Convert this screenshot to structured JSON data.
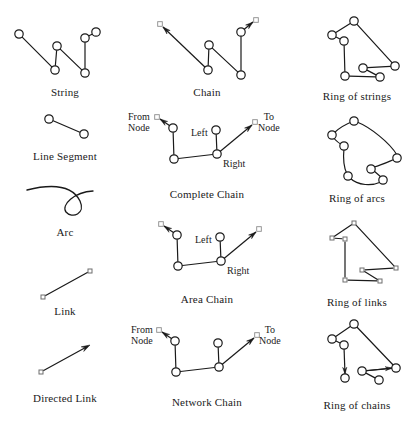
{
  "page": {
    "width": 414,
    "height": 422,
    "background": "#ffffff",
    "ink": "#1a1a1a"
  },
  "figures": [
    {
      "id": "string",
      "caption": "String",
      "caption_x": 65,
      "caption_y": 86,
      "node_style": "circle",
      "end_style": "none",
      "nodes": [
        [
          19,
          34
        ],
        [
          55,
          70
        ],
        [
          57,
          46
        ],
        [
          85,
          73
        ],
        [
          85,
          38
        ],
        [
          96,
          32
        ]
      ],
      "edges": [
        [
          0,
          1
        ],
        [
          1,
          2
        ],
        [
          2,
          3
        ],
        [
          3,
          4
        ],
        [
          4,
          5
        ]
      ]
    },
    {
      "id": "line-segment",
      "caption": "Line Segment",
      "caption_x": 65,
      "caption_y": 150,
      "node_style": "circle",
      "end_style": "none",
      "nodes": [
        [
          49,
          119
        ],
        [
          84,
          134
        ]
      ],
      "edges": [
        [
          0,
          1
        ]
      ]
    },
    {
      "id": "arc",
      "caption": "Arc",
      "caption_x": 65,
      "caption_y": 226,
      "node_style": "none",
      "end_style": "none",
      "curve": "M 27 190 C 55 183 73 187 80 201 C 86 214 72 219 66 212 C 61 205 74 192 93 191"
    },
    {
      "id": "link",
      "caption": "Link",
      "caption_x": 65,
      "caption_y": 305,
      "node_style": "square",
      "end_style": "none",
      "nodes": [
        [
          43,
          297
        ],
        [
          90,
          271
        ]
      ],
      "edges": [
        [
          0,
          1
        ]
      ]
    },
    {
      "id": "directed-link",
      "caption": "Directed Link",
      "caption_x": 65,
      "caption_y": 392,
      "node_style": "square",
      "end_style": "arrow-end",
      "nodes": [
        [
          41,
          372
        ],
        [
          90,
          345
        ]
      ],
      "edges": [
        [
          0,
          1
        ]
      ]
    },
    {
      "id": "chain",
      "caption": "Chain",
      "caption_x": 207,
      "caption_y": 86,
      "node_style": "circle",
      "end_style": "arrow-both",
      "nodes": [
        [
          208,
          70
        ],
        [
          209,
          45
        ],
        [
          241,
          75
        ],
        [
          241,
          32
        ]
      ],
      "edges": [
        [
          0,
          1
        ],
        [
          1,
          2
        ],
        [
          2,
          3
        ]
      ],
      "tail_arrow": {
        "from": [
          208,
          70
        ],
        "to": [
          163,
          27
        ],
        "marker": [
          160,
          24
        ]
      },
      "head_arrow": {
        "from": [
          241,
          32
        ],
        "to": [
          253,
          22
        ],
        "marker": [
          256,
          20
        ]
      }
    },
    {
      "id": "complete-chain",
      "caption": "Complete Chain",
      "caption_x": 207,
      "caption_y": 188,
      "node_style": "circle",
      "end_style": "arrow-both",
      "nodes": [
        [
          174,
          159
        ],
        [
          173,
          128
        ],
        [
          217,
          154
        ],
        [
          216,
          130
        ]
      ],
      "edges": [
        [
          0,
          1
        ],
        [
          0,
          2
        ],
        [
          2,
          3
        ]
      ],
      "tail_arrow": {
        "from": [
          173,
          128
        ],
        "to": [
          160,
          119
        ],
        "marker": [
          157,
          117
        ]
      },
      "head_arrow": {
        "from": [
          217,
          154
        ],
        "to": [
          252,
          125
        ],
        "marker": [
          255,
          122
        ]
      },
      "annotations": [
        {
          "text": "From\nNode",
          "x": 128,
          "y": 112
        },
        {
          "text": "Left",
          "x": 191,
          "y": 128
        },
        {
          "text": "Right",
          "x": 223,
          "y": 159
        },
        {
          "text": "To\nNode",
          "x": 258,
          "y": 112
        }
      ]
    },
    {
      "id": "area-chain",
      "caption": "Area Chain",
      "caption_x": 207,
      "caption_y": 293,
      "node_style": "circle",
      "end_style": "arrow-both",
      "nodes": [
        [
          178,
          266
        ],
        [
          177,
          235
        ],
        [
          221,
          261
        ],
        [
          220,
          237
        ]
      ],
      "edges": [
        [
          0,
          1
        ],
        [
          0,
          2
        ],
        [
          2,
          3
        ]
      ],
      "tail_arrow": {
        "from": [
          177,
          235
        ],
        "to": [
          164,
          226
        ],
        "marker": [
          161,
          224
        ]
      },
      "head_arrow": {
        "from": [
          221,
          261
        ],
        "to": [
          256,
          232
        ],
        "marker": [
          259,
          229
        ]
      },
      "annotations": [
        {
          "text": "Left",
          "x": 195,
          "y": 235
        },
        {
          "text": "Right",
          "x": 227,
          "y": 266
        }
      ]
    },
    {
      "id": "network-chain",
      "caption": "Network Chain",
      "caption_x": 207,
      "caption_y": 396,
      "node_style": "circle",
      "end_style": "arrow-both",
      "nodes": [
        [
          176,
          372
        ],
        [
          175,
          341
        ],
        [
          219,
          367
        ],
        [
          218,
          343
        ]
      ],
      "edges": [
        [
          0,
          1
        ],
        [
          0,
          2
        ],
        [
          2,
          3
        ]
      ],
      "tail_arrow": {
        "from": [
          175,
          341
        ],
        "to": [
          162,
          332
        ],
        "marker": [
          159,
          330
        ]
      },
      "head_arrow": {
        "from": [
          219,
          367
        ],
        "to": [
          254,
          338
        ],
        "marker": [
          257,
          335
        ]
      },
      "annotations": [
        {
          "text": "From\nNode",
          "x": 131,
          "y": 325
        },
        {
          "text": "To\nNode",
          "x": 259,
          "y": 325
        }
      ]
    },
    {
      "id": "ring-of-strings",
      "caption": "Ring of strings",
      "caption_x": 357,
      "caption_y": 90,
      "node_style": "circle",
      "end_style": "none",
      "nodes": [
        [
          354,
          21
        ],
        [
          332,
          35
        ],
        [
          344,
          41
        ],
        [
          345,
          76
        ],
        [
          380,
          77
        ],
        [
          363,
          68
        ],
        [
          395,
          66
        ]
      ],
      "edges": [
        [
          0,
          1
        ],
        [
          1,
          2
        ],
        [
          2,
          3
        ],
        [
          3,
          4
        ],
        [
          4,
          5
        ],
        [
          5,
          6
        ],
        [
          6,
          0
        ]
      ]
    },
    {
      "id": "ring-of-arcs",
      "caption": "Ring of arcs",
      "caption_x": 357,
      "caption_y": 192,
      "node_style": "circle",
      "end_style": "none",
      "nodes": [
        [
          354,
          121
        ],
        [
          332,
          135
        ],
        [
          344,
          146
        ],
        [
          348,
          176
        ],
        [
          383,
          180
        ],
        [
          371,
          169
        ],
        [
          397,
          158
        ]
      ],
      "arc_curves": [
        "M 354 121 C 346 124 338 129 334 133",
        "M 332 136 C 336 141 340 144 343 145",
        "M 344 148 C 343 158 344 168 347 174",
        "M 350 178 C 358 186 372 186 381 182",
        "M 382 178 C 379 175 375 172 373 170",
        "M 374 167 C 382 165 390 161 395 159",
        "M 397 155 C 390 143 370 127 357 122"
      ]
    },
    {
      "id": "ring-of-links",
      "caption": "Ring of links",
      "caption_x": 357,
      "caption_y": 296,
      "node_style": "square",
      "end_style": "none",
      "nodes": [
        [
          354,
          223
        ],
        [
          332,
          238
        ],
        [
          345,
          239
        ],
        [
          345,
          280
        ],
        [
          380,
          281
        ],
        [
          362,
          270
        ],
        [
          396,
          268
        ]
      ],
      "edges": [
        [
          0,
          1
        ],
        [
          1,
          2
        ],
        [
          2,
          3
        ],
        [
          3,
          4
        ],
        [
          4,
          5
        ],
        [
          5,
          6
        ],
        [
          6,
          0
        ]
      ]
    },
    {
      "id": "ring-of-chains",
      "caption": "Ring of chains",
      "caption_x": 357,
      "caption_y": 399,
      "node_style": "circle",
      "end_style": "arrow-segments",
      "nodes": [
        [
          354,
          324
        ],
        [
          332,
          339
        ],
        [
          344,
          345
        ],
        [
          345,
          378
        ],
        [
          379,
          380
        ],
        [
          362,
          371
        ],
        [
          396,
          368
        ]
      ],
      "edges": [
        [
          0,
          1
        ],
        [
          1,
          2
        ],
        [
          4,
          5
        ],
        [
          5,
          6
        ],
        [
          6,
          0
        ]
      ],
      "arrow_edges": [
        {
          "from": [
            344,
            347
          ],
          "to": [
            345,
            374
          ],
          "marker": [
            345,
            378
          ]
        },
        {
          "from": [
            364,
            371
          ],
          "to": [
            392,
            368
          ],
          "marker": [
            396,
            368
          ]
        }
      ]
    }
  ]
}
